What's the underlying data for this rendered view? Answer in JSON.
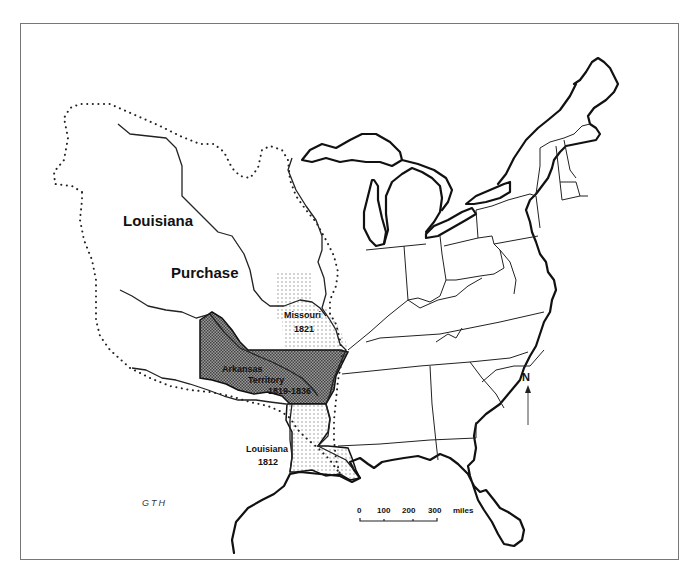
{
  "map": {
    "title_label_line1": "Louisiana",
    "title_label_line2": "Purchase",
    "regions": [
      {
        "name": "Missouri",
        "year": "1821",
        "fill": "light-stipple"
      },
      {
        "name": "Arkansas",
        "name_line2": "Territory",
        "year": "1819-1836",
        "fill": "dark-crosshatch"
      },
      {
        "name": "Louisiana",
        "year": "1812",
        "fill": "light-stipple"
      }
    ],
    "credit": "GTH",
    "north_arrow": {
      "label": "N",
      "icon": "north-arrow-icon"
    },
    "scale_bar": {
      "ticks": [
        "0",
        "100",
        "200",
        "300"
      ],
      "unit": "miles"
    },
    "colors": {
      "line": "#111111",
      "stipple": "#999999",
      "crosshatch": "#555555",
      "frame": "#777777",
      "background": "#ffffff"
    }
  }
}
